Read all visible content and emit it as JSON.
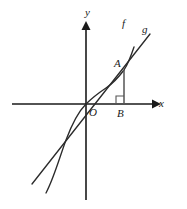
{
  "figure": {
    "background_color": "#ffffff",
    "stroke_color": "#1a1a1a",
    "curve_color": "#2b2b2b",
    "helper_color": "#555555",
    "width": 187,
    "height": 209
  },
  "axes": {
    "x_label": "x",
    "y_label": "y",
    "origin_label": "O",
    "x_axis_y_px": 104,
    "y_axis_x_px": 86,
    "x_axis_start_px": 12,
    "x_axis_end_px": 155,
    "y_axis_top_px": 24,
    "y_axis_bottom_px": 200
  },
  "points": [
    {
      "name": "A",
      "label": "A",
      "x_px": 124,
      "y_px": 70,
      "description": "intersection of curve f and line g in the first quadrant"
    },
    {
      "name": "B",
      "label": "B",
      "x_px": 124,
      "y_px": 104,
      "description": "foot of perpendicular from A on the x-axis"
    },
    {
      "name": "O",
      "label": "O",
      "x_px": 86,
      "y_px": 104,
      "description": "origin"
    }
  ],
  "curves": [
    {
      "name": "f",
      "label": "f",
      "type": "cubic-s-curve",
      "description": "S-shaped (cubic-like) curve through the origin, steeper than g near A",
      "path": "M 46,193 C 54,178 60,156 66,140 C 72,124 78,112 86,104 C 94,96 100,92 106,88 C 112,84 118,78 124,70 C 128,64 131,56 134,47"
    },
    {
      "name": "g",
      "label": "g",
      "type": "line",
      "description": "straight line through the origin passing through A",
      "path": "M 32,184 L 150,34"
    }
  ],
  "annotations": {
    "right_angle_marker": "right angle at B between AB and the x-axis",
    "drop_segment": "vertical segment from A down to B"
  }
}
